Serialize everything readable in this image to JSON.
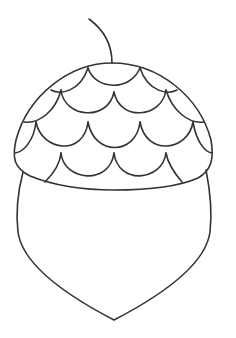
{
  "image": {
    "subject": "acorn line drawing",
    "line_color": "#333333",
    "background_color": "#ffffff",
    "parts": [
      "stem",
      "cap",
      "cap-scales",
      "nut-body"
    ]
  }
}
